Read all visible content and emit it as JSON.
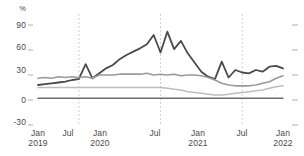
{
  "chart_data": {
    "type": "line",
    "title": "",
    "subtitle": "",
    "xlabel": "",
    "ylabel": "%",
    "unit_label": "%",
    "grid": "vertical-dashed-annual-july",
    "legend": "none",
    "ylim": [
      -30,
      90
    ],
    "yticks": [
      90,
      60,
      30,
      0,
      -30
    ],
    "ytick_labels": [
      "90",
      "60",
      "30",
      "0",
      "-30"
    ],
    "xlim": [
      "2019-01",
      "2022-01"
    ],
    "xticks": [
      "2019-01",
      "2019-07",
      "2020-01",
      "2020-07",
      "2021-01",
      "2021-07",
      "2022-01"
    ],
    "xtick_labels": [
      {
        "month": "Jan",
        "year": "2019"
      },
      {
        "month": "Jul",
        "year": ""
      },
      {
        "month": "Jan",
        "year": "2020"
      },
      {
        "month": "Jul",
        "year": ""
      },
      {
        "month": "Jan",
        "year": "2021"
      },
      {
        "month": "Jul",
        "year": ""
      },
      {
        "month": "Jan",
        "year": "2022"
      }
    ],
    "x": [
      "2019-01",
      "2019-02",
      "2019-03",
      "2019-04",
      "2019-05",
      "2019-06",
      "2019-07",
      "2019-08",
      "2019-09",
      "2019-10",
      "2019-11",
      "2019-12",
      "2020-01",
      "2020-02",
      "2020-03",
      "2020-04",
      "2020-05",
      "2020-06",
      "2020-07",
      "2020-08",
      "2020-09",
      "2020-10",
      "2020-11",
      "2020-12",
      "2021-01",
      "2021-02",
      "2021-03",
      "2021-04",
      "2021-05",
      "2021-06",
      "2021-07",
      "2021-08",
      "2021-09",
      "2021-10",
      "2021-11",
      "2021-12",
      "2022-01"
    ],
    "series": [
      {
        "name": "series-1-dark",
        "color": "#4a4a4a",
        "width": 1.8,
        "values": [
          18,
          19,
          20,
          21,
          22,
          24,
          25,
          43,
          26,
          32,
          38,
          42,
          49,
          54,
          58,
          62,
          67,
          78,
          57,
          82,
          61,
          71,
          56,
          45,
          34,
          28,
          25,
          46,
          27,
          36,
          33,
          32,
          36,
          34,
          40,
          41,
          38
        ]
      },
      {
        "name": "series-2-mid-gray",
        "color": "#9a9a9a",
        "width": 1.6,
        "values": [
          26,
          27,
          26,
          28,
          27,
          28,
          27,
          28,
          26,
          30,
          30,
          30,
          31,
          31,
          31,
          31,
          32,
          30,
          31,
          30,
          31,
          29,
          30,
          30,
          29,
          27,
          24,
          20,
          18,
          17,
          17,
          17,
          18,
          20,
          22,
          26,
          29
        ]
      },
      {
        "name": "series-3-light-gray",
        "color": "#bdbdbd",
        "width": 1.6,
        "values": [
          15,
          15,
          15,
          15,
          15,
          15,
          15,
          15,
          15,
          15,
          15,
          15,
          15,
          15,
          15,
          15,
          15,
          15,
          15,
          14,
          13,
          12,
          10,
          9,
          8,
          7,
          6,
          6,
          7,
          8,
          9,
          10,
          11,
          12,
          14,
          16,
          17
        ]
      },
      {
        "name": "series-4-dark-flat",
        "color": "#6e6e6e",
        "width": 1.5,
        "values": [
          2,
          2,
          2,
          2,
          2,
          2,
          2,
          2,
          2,
          2,
          2,
          2,
          2,
          2,
          2,
          2,
          2,
          2,
          2,
          2,
          2,
          2,
          2,
          2,
          2,
          2,
          2,
          2,
          2,
          2,
          2,
          2,
          2,
          2,
          2,
          2,
          2
        ]
      }
    ],
    "vertical_gridlines": [
      "2019-07",
      "2020-07",
      "2021-07"
    ],
    "gridline_color": "#cccccc",
    "axis_text_color": "#4a4a4a",
    "background": "#ffffff"
  }
}
